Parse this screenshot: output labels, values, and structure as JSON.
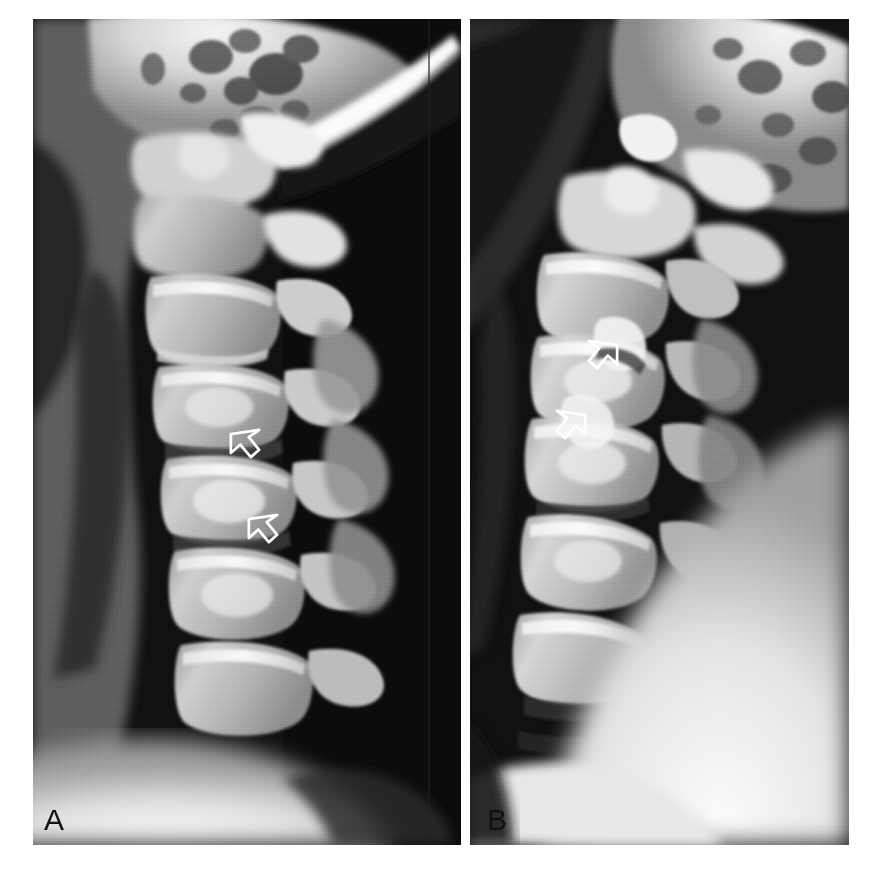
{
  "figure": {
    "type": "radiograph-figure",
    "modality": "plain-film-radiograph",
    "view": "lateral cervical spine",
    "background_color": "#ffffff",
    "panel_count": 2,
    "width": 869,
    "height": 885
  },
  "panels": [
    {
      "id": "A",
      "label": "A",
      "label_color": "#111111",
      "x": 33,
      "y": 19,
      "width": 428,
      "height": 826,
      "description": "Lateral cervical spine radiograph, neutral/extension position",
      "arrow_count": 2,
      "arrows": [
        {
          "id": "a-arrow-1",
          "x": 222,
          "y": 414,
          "direction": "right-down",
          "style": "open-white-outline"
        },
        {
          "id": "a-arrow-2",
          "x": 240,
          "y": 499,
          "direction": "right-down",
          "style": "open-white-outline"
        }
      ]
    },
    {
      "id": "B",
      "label": "B",
      "label_color": "#111111",
      "x": 470,
      "y": 19,
      "width": 379,
      "height": 826,
      "description": "Lateral cervical spine radiograph, flexion position",
      "arrow_count": 2,
      "arrows": [
        {
          "id": "b-arrow-1",
          "x": 622,
          "y": 314,
          "direction": "left-up",
          "style": "open-white-outline"
        },
        {
          "id": "b-arrow-2",
          "x": 592,
          "y": 384,
          "direction": "left-up",
          "style": "open-white-outline"
        }
      ]
    }
  ],
  "colors": {
    "page_background": "#ffffff",
    "film_dark": "#0d0d0d",
    "soft_tissue": "#6e6e6e",
    "bone_mid": "#b4b4b4",
    "bone_bright": "#eaeaea",
    "bone_white": "#fdfdfd",
    "arrow_outline": "#ffffff",
    "label_text": "#111111"
  },
  "anatomy": {
    "structures_visible": [
      "occiput",
      "mastoid air cells",
      "mandible",
      "atlas (C1)",
      "axis (C2) with odontoid process",
      "C3 vertebral body",
      "C4 vertebral body",
      "C5 vertebral body",
      "C6 vertebral body",
      "C7 vertebral body",
      "spinous processes",
      "facet joints",
      "intervertebral disc spaces",
      "prevertebral soft tissue",
      "shoulder soft tissue"
    ]
  }
}
